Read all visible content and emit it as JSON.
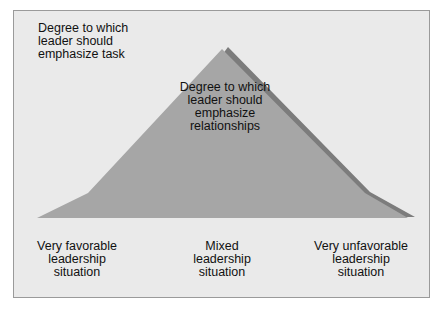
{
  "diagram": {
    "type": "leadership-contingency-curve",
    "colors": {
      "background": "#eaeaea",
      "frame_border": "#9a9a9a",
      "relationships_fill": "#a6a6a6",
      "shadow_fill": "#7c7c7c"
    },
    "task_label": [
      "Degree to which",
      "leader should",
      "emphasize task"
    ],
    "relationships_label": [
      "Degree to which",
      "leader should",
      "emphasize",
      "relationships"
    ],
    "situations": [
      {
        "lines": [
          "Very favorable",
          "leadership",
          "situation"
        ]
      },
      {
        "lines": [
          "Mixed",
          "leadership",
          "situation"
        ]
      },
      {
        "lines": [
          "Very unfavorable",
          "leadership",
          "situation"
        ]
      }
    ]
  }
}
